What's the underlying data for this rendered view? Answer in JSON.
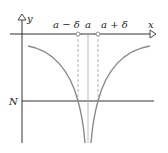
{
  "diagram": {
    "axes": {
      "y_label": "y",
      "x_label": "x"
    },
    "labels": {
      "a_minus_delta": "a − δ",
      "a": "a",
      "a_plus_delta": "a + δ",
      "N": "N"
    },
    "colors": {
      "axis": "#333333",
      "curve": "#8a8a8a",
      "dashed": "#b0b0b0",
      "point_fill": "#ffffff"
    }
  }
}
